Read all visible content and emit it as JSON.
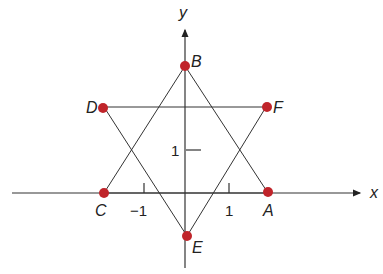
{
  "axes": {
    "x_label": "x",
    "y_label": "y"
  },
  "ticks": {
    "x_neg": "−1",
    "x_pos": "1",
    "y_pos": "1"
  },
  "points": {
    "A": {
      "label": "A",
      "coords": [
        2,
        0
      ]
    },
    "B": {
      "label": "B",
      "coords": [
        0,
        3
      ]
    },
    "C": {
      "label": "C",
      "coords": [
        -2,
        0
      ]
    },
    "D": {
      "label": "D",
      "coords": [
        -2,
        2
      ]
    },
    "E": {
      "label": "E",
      "coords": [
        0,
        -1
      ]
    },
    "F": {
      "label": "F",
      "coords": [
        2,
        2
      ]
    }
  },
  "colors": {
    "point": "#c0242a",
    "line": "#333333"
  }
}
